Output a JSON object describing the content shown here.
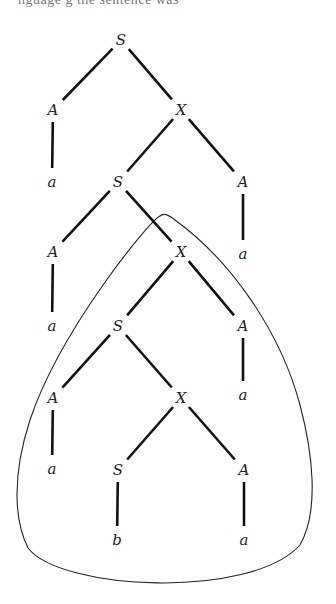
{
  "top_text": "nguage g                    the sentence was",
  "tree": {
    "nodes": [
      {
        "id": "n0",
        "label": "S",
        "x": 121,
        "y": 40
      },
      {
        "id": "n1",
        "label": "A",
        "x": 53,
        "y": 110
      },
      {
        "id": "n2",
        "label": "X",
        "x": 181,
        "y": 110
      },
      {
        "id": "n3",
        "label": "a",
        "x": 52,
        "y": 182
      },
      {
        "id": "n4",
        "label": "S",
        "x": 118,
        "y": 182
      },
      {
        "id": "n5",
        "label": "A",
        "x": 243,
        "y": 182
      },
      {
        "id": "n6",
        "label": "A",
        "x": 53,
        "y": 252
      },
      {
        "id": "n7",
        "label": "X",
        "x": 181,
        "y": 252
      },
      {
        "id": "n8",
        "label": "a",
        "x": 243,
        "y": 254
      },
      {
        "id": "n9",
        "label": "a",
        "x": 52,
        "y": 326
      },
      {
        "id": "n10",
        "label": "S",
        "x": 118,
        "y": 326
      },
      {
        "id": "n11",
        "label": "A",
        "x": 243,
        "y": 326
      },
      {
        "id": "n12",
        "label": "A",
        "x": 53,
        "y": 398
      },
      {
        "id": "n13",
        "label": "X",
        "x": 181,
        "y": 398
      },
      {
        "id": "n14",
        "label": "a",
        "x": 243,
        "y": 395
      },
      {
        "id": "n15",
        "label": "a",
        "x": 52,
        "y": 469
      },
      {
        "id": "n16",
        "label": "S",
        "x": 118,
        "y": 470
      },
      {
        "id": "n17",
        "label": "A",
        "x": 244,
        "y": 470
      },
      {
        "id": "n18",
        "label": "b",
        "x": 117,
        "y": 540
      },
      {
        "id": "n19",
        "label": "a",
        "x": 244,
        "y": 540
      }
    ],
    "edges": [
      {
        "from": "n0",
        "to": "n1"
      },
      {
        "from": "n0",
        "to": "n2"
      },
      {
        "from": "n1",
        "to": "n3"
      },
      {
        "from": "n2",
        "to": "n4"
      },
      {
        "from": "n2",
        "to": "n5"
      },
      {
        "from": "n4",
        "to": "n6"
      },
      {
        "from": "n4",
        "to": "n7"
      },
      {
        "from": "n5",
        "to": "n8"
      },
      {
        "from": "n6",
        "to": "n9"
      },
      {
        "from": "n7",
        "to": "n10"
      },
      {
        "from": "n7",
        "to": "n11"
      },
      {
        "from": "n10",
        "to": "n12"
      },
      {
        "from": "n10",
        "to": "n13"
      },
      {
        "from": "n11",
        "to": "n14"
      },
      {
        "from": "n12",
        "to": "n15"
      },
      {
        "from": "n13",
        "to": "n16"
      },
      {
        "from": "n13",
        "to": "n17"
      },
      {
        "from": "n16",
        "to": "n18"
      },
      {
        "from": "n17",
        "to": "n19"
      }
    ]
  },
  "highlight_loop": {
    "description": "closed curve enclosing the subtree rooted at the second X",
    "encloses_root": "n7"
  }
}
